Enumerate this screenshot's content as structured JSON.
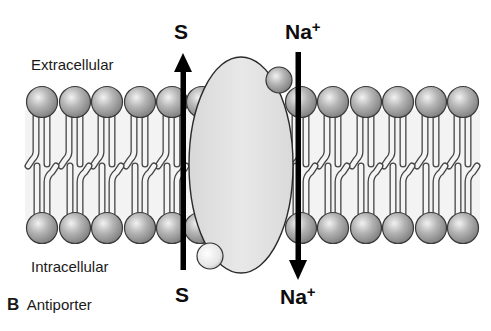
{
  "figure": {
    "panel_letter": "B",
    "caption": "Antiporter",
    "regions": {
      "top": "Extracellular",
      "bottom": "Intracellular"
    },
    "substances": [
      {
        "name": "S",
        "top_label": "S",
        "bottom_label": "S",
        "direction": "intracellular-to-extracellular"
      },
      {
        "name": "Na",
        "charge": "+",
        "top_label": "Na",
        "bottom_label": "Na",
        "direction": "extracellular-to-intracellular"
      }
    ],
    "colors": {
      "protein_fill": "#e3e3e3",
      "lipid_head": "#9a9a9a",
      "arrow": "#000000",
      "outline": "#333333"
    }
  }
}
